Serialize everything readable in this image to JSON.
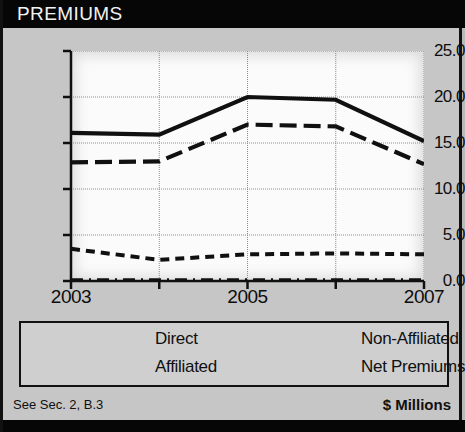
{
  "header": {
    "title": "PREMIUMS"
  },
  "footer": {
    "left_note": "See Sec. 2, B.3",
    "right_note": "$ Millions"
  },
  "legend": {
    "entries": [
      {
        "label": "Direct",
        "style": "dash-dot"
      },
      {
        "label": "Non-Affiliated",
        "style": "long-dash"
      },
      {
        "label": "Affiliated",
        "style": "dashed"
      },
      {
        "label": "Net Premiums",
        "style": "solid"
      }
    ]
  },
  "colors": {
    "title_bar": "#060606",
    "panel": "#c6c6c6",
    "plot": "#fbfbfb",
    "line": "#101010"
  },
  "chart_data": {
    "type": "line",
    "title": "PREMIUMS",
    "xlabel": "",
    "ylabel": "",
    "unit_note": "$ Millions",
    "x": [
      2003,
      2004,
      2005,
      2006,
      2007
    ],
    "categories": [
      "2003",
      "2004",
      "2005",
      "2006",
      "2007"
    ],
    "xtick_labels": [
      "2003",
      "",
      "2005",
      "",
      "2007"
    ],
    "ytick_labels": [
      "0.0",
      "5.0",
      "10.0",
      "15.0",
      "20.0",
      "25.0"
    ],
    "yticks": [
      0,
      5,
      10,
      15,
      20,
      25
    ],
    "ylim": [
      0,
      25
    ],
    "xlim": [
      2003,
      2007
    ],
    "grid": true,
    "legend_position": "below",
    "series": [
      {
        "name": "Direct",
        "style": "dash-dot",
        "values": [
          0.1,
          0.1,
          0.1,
          0.1,
          0.1
        ]
      },
      {
        "name": "Affiliated",
        "style": "dashed",
        "values": [
          3.5,
          2.3,
          2.9,
          3.0,
          2.9
        ]
      },
      {
        "name": "Non-Affiliated",
        "style": "long-dash",
        "values": [
          12.9,
          13.0,
          17.0,
          16.8,
          12.7
        ]
      },
      {
        "name": "Net Premiums",
        "style": "solid",
        "values": [
          16.1,
          15.9,
          20.0,
          19.7,
          15.2
        ]
      }
    ]
  }
}
